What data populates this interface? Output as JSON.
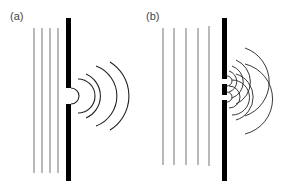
{
  "panels": [
    {
      "label": "(a)",
      "description": "Single slit diffraction: plane waves pass through one opening and spread as circular waves",
      "incident_wavefronts": 4,
      "slits": 1,
      "diffracted_arcs": 5
    },
    {
      "label": "(b)",
      "description": "Double slit: plane waves pass through two openings producing overlapping circular waves (interference)",
      "incident_wavefronts": 5,
      "slits": 2,
      "diffracted_arcs_per_slit": 5
    }
  ],
  "colors": {
    "wavefront": "#8a8a8a",
    "barrier": "#000000",
    "arc": "#222222"
  }
}
